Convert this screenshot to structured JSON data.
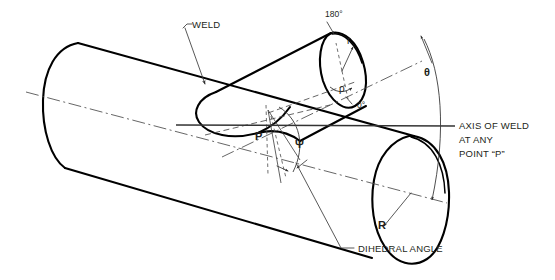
{
  "diagram": {
    "type": "technical-line-drawing",
    "background_color": "#ffffff",
    "line_color": "#000000",
    "annotation_color": "#3a3a3a",
    "labels": {
      "weld": "WELD",
      "angle_180": "180°",
      "angle_0": "0°",
      "theta": "θ",
      "psi": "Ψ",
      "rho": "ρ",
      "radius_branch": "r",
      "radius_header": "R",
      "point_p": "P",
      "axis_line_1": "AXIS OF WELD",
      "axis_line_2": "AT ANY",
      "axis_line_3": "POINT “P”",
      "dihedral": "DIHEDRAL ANGLE"
    },
    "icons": {
      "arrow_head": "arrow-head-icon",
      "leader_hook": "leader-hook-icon"
    }
  }
}
